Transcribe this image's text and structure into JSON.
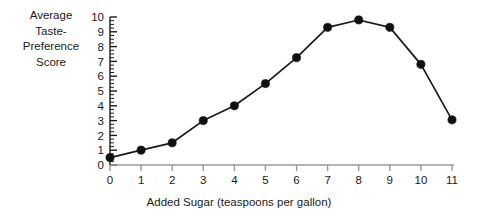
{
  "chart_data": {
    "type": "line",
    "title": "",
    "subtitle": "",
    "xlabel": "Added Sugar (teaspoons per gallon)",
    "ylabel": "Average Taste-Preference Score",
    "ylabel_lines": [
      "Average",
      "Taste-",
      "Preference",
      "Score"
    ],
    "x": [
      0,
      1,
      2,
      3,
      4,
      5,
      6,
      7,
      8,
      9,
      10,
      11
    ],
    "values": [
      0.5,
      1.0,
      1.5,
      3.0,
      4.0,
      5.5,
      7.25,
      9.3,
      9.8,
      9.3,
      6.8,
      3.05
    ],
    "xtick_labels": [
      "0",
      "1",
      "2",
      "3",
      "4",
      "5",
      "6",
      "7",
      "8",
      "9",
      "10",
      "11"
    ],
    "ytick_labels": [
      "0",
      "1",
      "2",
      "3",
      "4",
      "5",
      "6",
      "7",
      "8",
      "9",
      "10"
    ],
    "yticks": [
      0,
      1,
      2,
      3,
      4,
      5,
      6,
      7,
      8,
      9,
      10
    ],
    "xlim": [
      0,
      11
    ],
    "ylim": [
      0,
      10
    ],
    "y_minor_tick_interval": 0.25,
    "grid": false,
    "legend": null,
    "marker": "filled-circle",
    "line_color": "#1a1a1a",
    "marker_color": "#111111",
    "xaxis_color": "#9a9a9a",
    "yaxis_color": "#1a1a1a",
    "background_color": "#ffffff"
  }
}
